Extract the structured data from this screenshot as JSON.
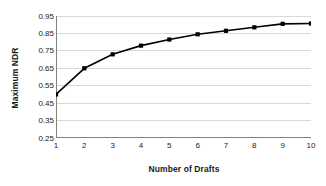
{
  "chart_data": {
    "type": "line",
    "title": "",
    "xlabel": "Number of Drafts",
    "ylabel": "Maximum NDR",
    "x": [
      1,
      2,
      3,
      4,
      5,
      6,
      7,
      8,
      9,
      10
    ],
    "values": [
      0.5,
      0.65,
      0.73,
      0.78,
      0.815,
      0.845,
      0.865,
      0.885,
      0.905,
      0.907
    ],
    "xlim": [
      1,
      10
    ],
    "ylim": [
      0.25,
      0.95
    ],
    "xticks": [
      "1",
      "2",
      "3",
      "4",
      "5",
      "6",
      "7",
      "8",
      "9",
      "10"
    ],
    "yticks": [
      "0.95",
      "0.85",
      "0.75",
      "0.65",
      "0.55",
      "0.45",
      "0.35",
      "0.25"
    ],
    "ytick_values": [
      0.95,
      0.85,
      0.75,
      0.65,
      0.55,
      0.45,
      0.35,
      0.25
    ],
    "grid": "horizontal",
    "legend": "none",
    "marker": "square",
    "series_color": "#000000",
    "grid_color": "#d9d9d9",
    "axis_color": "#808080",
    "background": "#ffffff"
  }
}
